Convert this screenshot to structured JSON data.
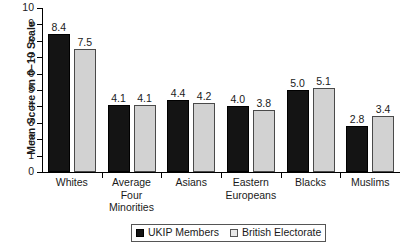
{
  "chart_data": {
    "type": "bar",
    "title": "",
    "xlabel": "",
    "ylabel": "Mean Score on 0–10 Scale",
    "ylim": [
      0,
      10
    ],
    "ytick_labels": [
      "0",
      "1",
      "2",
      "3",
      "4",
      "5",
      "6",
      "7",
      "8",
      "9",
      "10"
    ],
    "grid": false,
    "legend_position": "bottom",
    "categories": [
      "Whites",
      "Average\nFour\nMinorities",
      "Asians",
      "Eastern\nEuropeans",
      "Blacks",
      "Muslims"
    ],
    "series": [
      {
        "name": "UKIP Members",
        "color": "#141414",
        "values": [
          8.4,
          4.1,
          4.4,
          4.0,
          5.0,
          2.8
        ],
        "value_labels": [
          "8.4",
          "4.1",
          "4.4",
          "4.0",
          "5.0",
          "2.8"
        ]
      },
      {
        "name": "British Electorate",
        "color": "#d2d2d2",
        "values": [
          7.5,
          4.1,
          4.2,
          3.8,
          5.1,
          3.4
        ],
        "value_labels": [
          "7.5",
          "4.1",
          "4.2",
          "3.8",
          "5.1",
          "3.4"
        ]
      }
    ]
  },
  "axis": {
    "y_title": "Mean Score on 0–10 Scale"
  },
  "legend": {
    "items": [
      {
        "label": "UKIP Members"
      },
      {
        "label": "British Electorate"
      }
    ]
  }
}
